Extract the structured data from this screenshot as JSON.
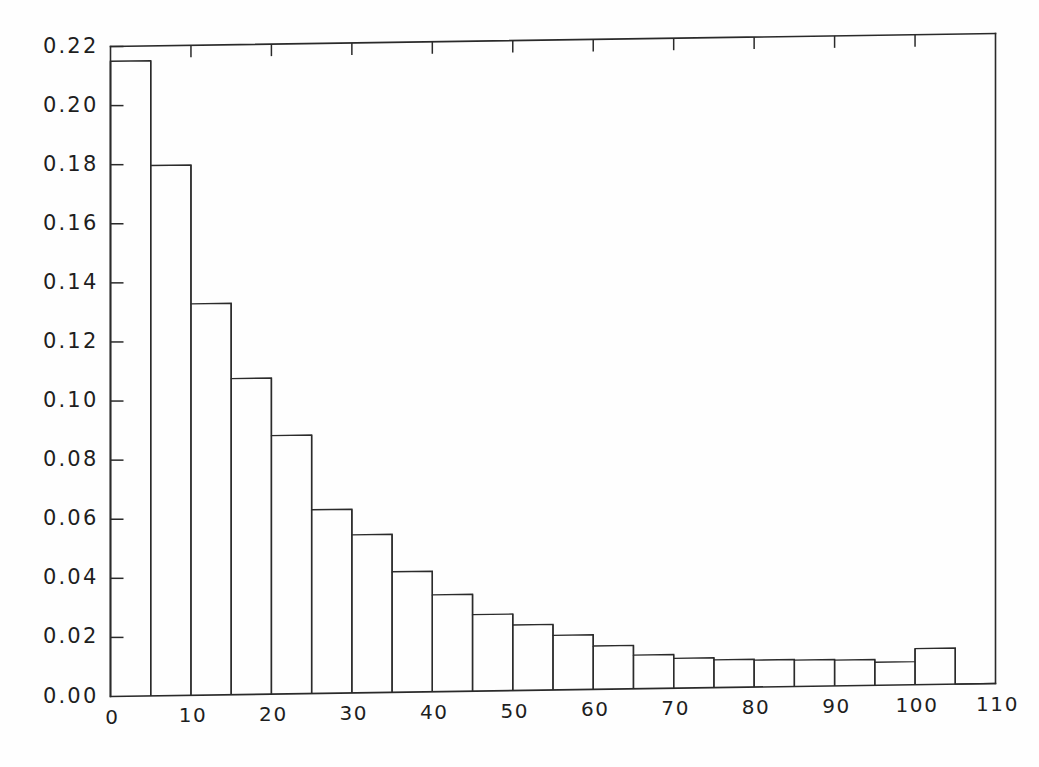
{
  "chart_data": {
    "type": "bar",
    "title": "",
    "subtitle": "",
    "xlabel": "",
    "ylabel": "",
    "grid": false,
    "legend": "none",
    "bar_style": "histogram-outline",
    "bin_width": 5,
    "xlim": [
      0,
      110
    ],
    "ylim": [
      0.0,
      0.22
    ],
    "xticks": [
      0,
      10,
      20,
      30,
      40,
      50,
      60,
      70,
      80,
      90,
      100,
      110
    ],
    "xtick_labels": [
      "0",
      "10",
      "20",
      "30",
      "40",
      "50",
      "60",
      "70",
      "80",
      "90",
      "100",
      "110"
    ],
    "yticks": [
      0.0,
      0.02,
      0.04,
      0.06,
      0.08,
      0.1,
      0.12,
      0.14,
      0.16,
      0.18,
      0.2,
      0.22
    ],
    "ytick_labels": [
      "0.00",
      "0.02",
      "0.04",
      "0.06",
      "0.08",
      "0.10",
      "0.12",
      "0.14",
      "0.16",
      "0.18",
      "0.20",
      "0.22"
    ],
    "bin_edges": [
      0,
      5,
      10,
      15,
      20,
      25,
      30,
      35,
      40,
      45,
      50,
      55,
      60,
      65,
      70,
      75,
      80,
      85,
      90,
      95,
      100,
      105,
      110
    ],
    "categories": [
      "0-5",
      "5-10",
      "10-15",
      "15-20",
      "20-25",
      "25-30",
      "30-35",
      "35-40",
      "40-45",
      "45-50",
      "50-55",
      "55-60",
      "60-65",
      "65-70",
      "70-75",
      "75-80",
      "80-85",
      "85-90",
      "90-95",
      "95-100",
      "100-105",
      "105-110"
    ],
    "values": [
      0.215,
      0.1795,
      0.1325,
      0.107,
      0.0875,
      0.0622,
      0.0535,
      0.0408,
      0.0328,
      0.0259,
      0.0222,
      0.0185,
      0.0147,
      0.0114,
      0.0101,
      0.0094,
      0.0091,
      0.0089,
      0.0087,
      0.0078,
      0.0122,
      0.0
    ]
  },
  "axes": {
    "top_axis_ticks": [
      10,
      20,
      30,
      40,
      50,
      60,
      70,
      80,
      90,
      100
    ],
    "frame": "box"
  }
}
